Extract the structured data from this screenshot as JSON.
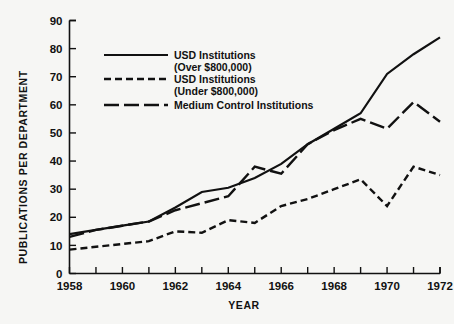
{
  "chart_data": {
    "type": "line",
    "title": "",
    "xlabel": "YEAR",
    "ylabel": "PUBLICATIONS PER DEPARTMENT",
    "xlim": [
      1958,
      1972
    ],
    "ylim": [
      0,
      90
    ],
    "grid": false,
    "legend_position": "upper-left-inside",
    "x": [
      1958,
      1959,
      1960,
      1961,
      1962,
      1963,
      1964,
      1965,
      1966,
      1967,
      1968,
      1969,
      1970,
      1971,
      1972
    ],
    "xticks": [
      1958,
      1959,
      1960,
      1961,
      1962,
      1963,
      1964,
      1965,
      1966,
      1967,
      1968,
      1969,
      1970,
      1971,
      1972
    ],
    "xtick_labels": [
      "1958",
      "",
      "1960",
      "",
      "1962",
      "",
      "1964",
      "",
      "1966",
      "",
      "1968",
      "",
      "1970",
      "",
      "1972"
    ],
    "yticks": [
      0,
      10,
      20,
      30,
      40,
      50,
      60,
      70,
      80,
      90
    ],
    "ytick_labels": [
      "0",
      "10",
      "20",
      "30",
      "40",
      "50",
      "60",
      "70",
      "80",
      "90"
    ],
    "series": [
      {
        "name": "USD Institutions (Over $800,000)",
        "legend_line1": "USD Institutions",
        "legend_line2": "(Over $800,000)",
        "style": "solid",
        "color": "#111111",
        "values": [
          14.0,
          15.5,
          17.0,
          18.5,
          23.5,
          29.0,
          30.5,
          34.0,
          39.0,
          46.0,
          51.5,
          57.0,
          71.0,
          78.0,
          84.0
        ]
      },
      {
        "name": "USD Institutions (Under $800,000)",
        "legend_line1": "USD Institutions",
        "legend_line2": "(Under $800,000)",
        "style": "dash-dot",
        "color": "#111111",
        "values": [
          8.5,
          9.5,
          10.5,
          11.5,
          15.0,
          14.5,
          19.0,
          18.0,
          24.0,
          26.5,
          30.0,
          33.5,
          24.0,
          38.0,
          35.0
        ]
      },
      {
        "name": "Medium Control Institutions",
        "legend_line1": "Medium Control Institutions",
        "legend_line2": "",
        "style": "long-dash",
        "color": "#111111",
        "values": [
          13.0,
          15.5,
          17.0,
          18.5,
          22.5,
          25.0,
          27.5,
          38.0,
          35.5,
          46.0,
          51.0,
          55.0,
          51.5,
          61.0,
          54.0
        ]
      }
    ]
  }
}
